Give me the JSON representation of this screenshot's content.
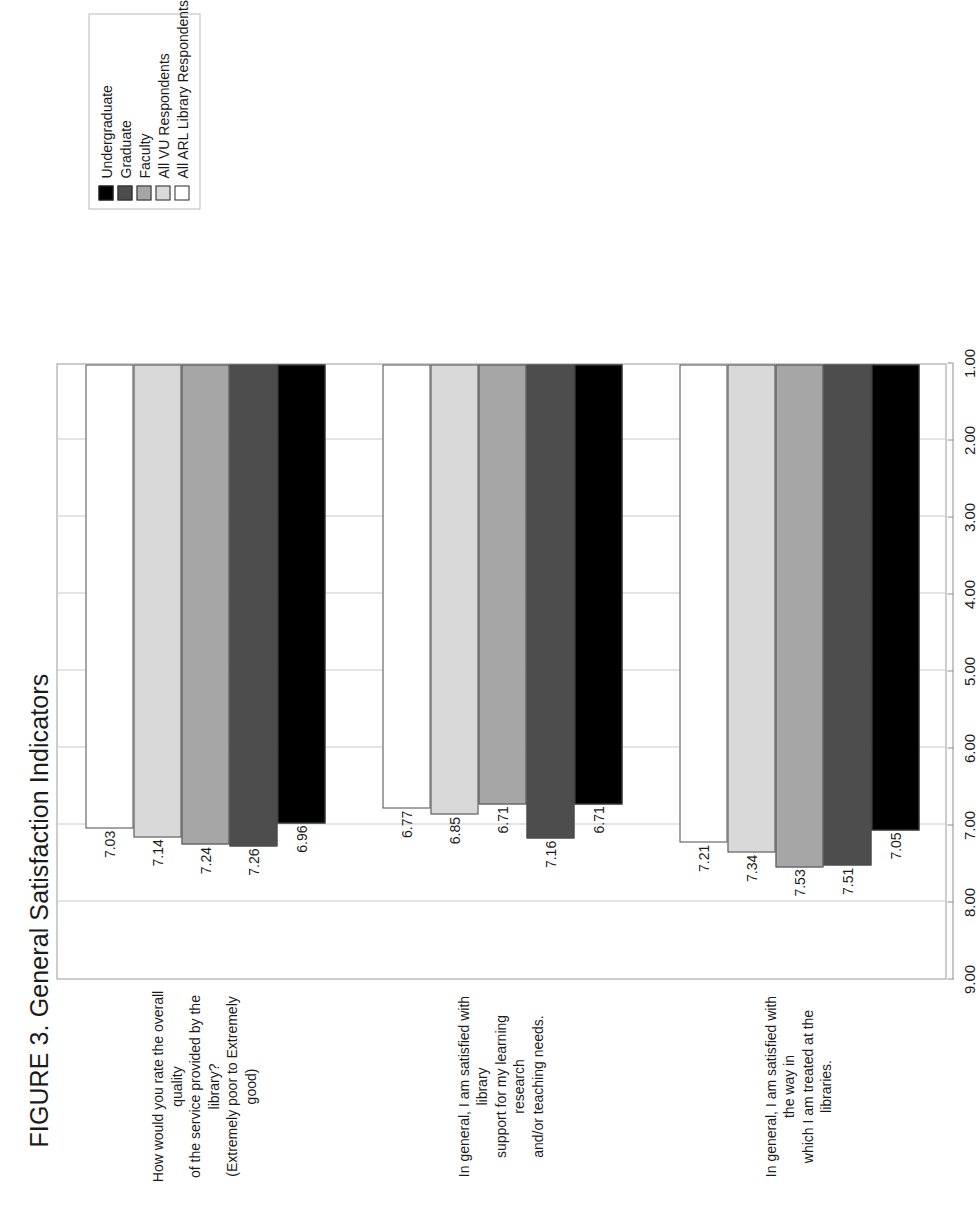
{
  "figure": {
    "title": "FIGURE 3. General Satisfaction Indicators"
  },
  "legend": {
    "entries": [
      {
        "label": "Undergraduate",
        "color": "#000000"
      },
      {
        "label": "Graduate",
        "color": "#4d4d4d"
      },
      {
        "label": "Faculty",
        "color": "#a6a6a6"
      },
      {
        "label": "All VU Respondents",
        "color": "#d9d9d9"
      },
      {
        "label": "All ARL Library Respondents",
        "color": "#ffffff"
      }
    ]
  },
  "chart_data": {
    "type": "bar",
    "orientation": "horizontal",
    "title": "FIGURE 3. General Satisfaction Indicators",
    "xlabel": "",
    "ylabel": "",
    "ylim": [
      1.0,
      9.0
    ],
    "axis_ticks": [
      "9.00",
      "8.00",
      "7.00",
      "6.00",
      "5.00",
      "4.00",
      "3.00",
      "2.00",
      "1.00"
    ],
    "axis_tick_values": [
      9.0,
      8.0,
      7.0,
      6.0,
      5.0,
      4.0,
      3.0,
      2.0,
      1.0
    ],
    "grid": true,
    "legend_position": "top-right",
    "categories": [
      "In general, I am satisfied with the way in which I am treated at the libraries.",
      "In general, I am satisfied with library support for my learning research and/or teaching needs.",
      "How would you rate the overall quality of the service provided by the library? (Extremely poor to Extremely good)"
    ],
    "category_lines": [
      [
        "In general, I am satisfied with the way in",
        "which I am treated at the libraries."
      ],
      [
        "In general, I am satisfied with library",
        "support for my learning research",
        "and/or teaching needs."
      ],
      [
        "How would you rate the overall quality",
        "of the service provided by the library?",
        "(Extremely poor to Extremely good)"
      ]
    ],
    "series": [
      {
        "name": "Undergraduate",
        "color": "#000000",
        "values": [
          7.05,
          6.71,
          6.96
        ],
        "labels": [
          "7.05",
          "6.71",
          "6.96"
        ]
      },
      {
        "name": "Graduate",
        "color": "#4d4d4d",
        "values": [
          7.51,
          7.16,
          7.26
        ],
        "labels": [
          "7.51",
          "7.16",
          "7.26"
        ]
      },
      {
        "name": "Faculty",
        "color": "#a6a6a6",
        "values": [
          7.53,
          6.71,
          7.24
        ],
        "labels": [
          "7.53",
          "6.71",
          "7.24"
        ]
      },
      {
        "name": "All VU Respondents",
        "color": "#d9d9d9",
        "values": [
          7.34,
          6.85,
          7.14
        ],
        "labels": [
          "7.34",
          "6.85",
          "7.14"
        ]
      },
      {
        "name": "All ARL Library Respondents",
        "color": "#ffffff",
        "values": [
          7.21,
          6.77,
          7.03
        ],
        "labels": [
          "7.21",
          "6.77",
          "7.03"
        ]
      }
    ]
  }
}
